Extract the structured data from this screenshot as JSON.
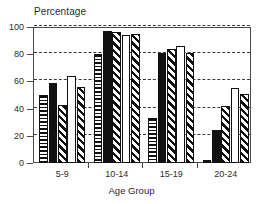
{
  "chart_data": {
    "type": "bar",
    "title": "Percentage",
    "xlabel": "Age Group",
    "ylabel": "",
    "categories": [
      "5-9",
      "10-14",
      "15-19",
      "20-24"
    ],
    "ylim": [
      0,
      100
    ],
    "yticks": [
      0,
      20,
      40,
      60,
      80,
      100
    ],
    "ytick_labels": [
      "0",
      "20",
      "40",
      "60",
      "80",
      "100"
    ],
    "grid": "horizontal-dashed",
    "legend": "none",
    "series": [
      {
        "name": "Series 1",
        "pattern": "horizontal-stripe",
        "values": [
          50,
          80,
          33,
          2
        ]
      },
      {
        "name": "Series 2",
        "pattern": "solid-black",
        "values": [
          59,
          97,
          81,
          24
        ]
      },
      {
        "name": "Series 3",
        "pattern": "diagonal-stripe",
        "values": [
          43,
          96,
          84,
          42
        ]
      },
      {
        "name": "Series 4",
        "pattern": "blank-white",
        "values": [
          64,
          94,
          86,
          55
        ]
      },
      {
        "name": "Series 5",
        "pattern": "diagonal-stripe",
        "values": [
          56,
          95,
          81,
          51
        ]
      }
    ]
  },
  "colors": {
    "ink": "#111111",
    "axis": "#4a4a4a",
    "grid": "#3a3a3a",
    "background": "#ffffff",
    "text": "#2b2b2b"
  }
}
